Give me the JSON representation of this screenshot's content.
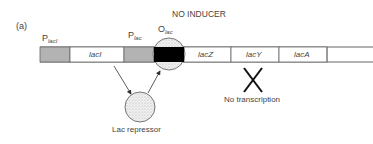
{
  "figure": {
    "panel_label": "(a)",
    "title": "NO INDUCER",
    "promoter_laci": {
      "main": "P",
      "sub": "lacI"
    },
    "gene_laci": "lacI",
    "promoter_lac": {
      "main": "P",
      "sub": "lac"
    },
    "operator_lac": {
      "main": "O",
      "sub": "lac"
    },
    "genes": [
      "lacZ",
      "lacY",
      "lacA"
    ],
    "repressor_label": "Lac repressor",
    "no_transcription_label": "No transcription",
    "colors": {
      "promoter": "#b3b3b3",
      "operator": "#000000",
      "line": "#666666",
      "repressor_fill": "#e6e6e6"
    }
  }
}
